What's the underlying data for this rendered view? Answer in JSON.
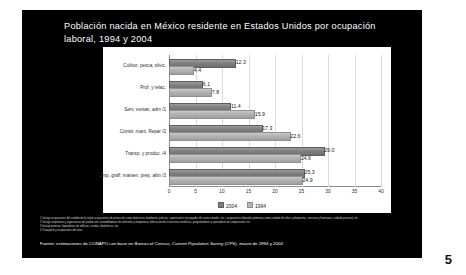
{
  "slide": {
    "title": "Población nacida en México residente en Estados Unidos por ocupación laboral, 1994 y 2004",
    "number": "5",
    "background_color": "#000000",
    "title_color": "#ffffff"
  },
  "chart_data": {
    "type": "bar",
    "orientation": "horizontal",
    "title": "Población nacida en México residente en Estados Unidos por ocupación laboral, 1994 y 2004",
    "xlabel": "",
    "ylabel": "",
    "xlim": [
      0,
      40
    ],
    "xticks": [
      "0",
      "5",
      "10",
      "15",
      "20",
      "25",
      "30",
      "35",
      "40"
    ],
    "grid": true,
    "legend_position": "bottom",
    "categories": [
      "Cultivo, pesca, silvic.",
      "Prof. y relac.",
      "Serv, ventas, adm /1",
      "Constr, mant, Repar /2",
      "Transp. y produc. /4",
      "Limp, graff, manten, prep, alim /3"
    ],
    "series": [
      {
        "name": "2004",
        "color": "#7d7d7d",
        "values": [
          12.3,
          6.1,
          11.4,
          17.3,
          29.0,
          25.3
        ]
      },
      {
        "name": "1994",
        "color": "#b6b6b6",
        "values": [
          4.4,
          7.8,
          15.9,
          22.6,
          24.6,
          24.9
        ]
      }
    ]
  },
  "footnotes": [
    "1 Incluye ocupaciones del cuidado de la salud, ocupaciones de protección como detectives, bomberos, policías, supervisores encargados de correccionales, etc.; ocupaciones laborales primarias como cuidado de niños, peluquerías, servicios y funerarios, cuidado personal, etc.",
    "2 Incluye carpinteros y supervisores de producción, ensambladores de vehículos y maquinaria, fabricación de estructuras metálicas, programadores y operadores de computación, etc.",
    "3 Incluye porteros, limpiadores de edificios, criadas, domésticas, etc.",
    "4 Transporte y ocupaciones del área."
  ],
  "source": {
    "prefix": "Fuente:  estimaciones de CONAPO con base en Bureau of Census, ",
    "italic": "Current Population Survey",
    "suffix": " (CPS), marzo de 1994 y 2004"
  }
}
